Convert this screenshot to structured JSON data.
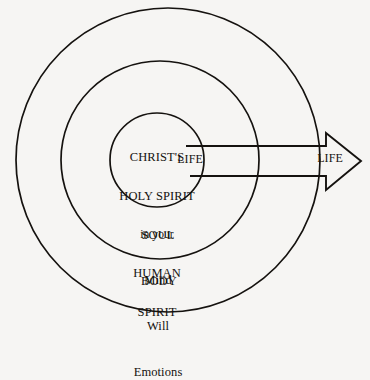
{
  "diagram": {
    "background_color": "#f6f5f3",
    "line_color": "#15120f",
    "rings": [
      {
        "name": "outer-ring",
        "label": "BODY",
        "cx": 168,
        "cy": 160,
        "r": 152
      },
      {
        "name": "middle-ring",
        "label": "SOUL",
        "cx": 160,
        "cy": 160,
        "r": 99
      },
      {
        "name": "inner-ring",
        "label": "SPIRIT",
        "cx": 157,
        "cy": 160,
        "r": 47
      }
    ],
    "spirit_lines": [
      {
        "text": "CHRIST'S",
        "style": "caps"
      },
      {
        "text": "HOLY SPIRIT",
        "style": "caps"
      },
      {
        "text": "in your",
        "style": "small"
      },
      {
        "text": "HUMAN",
        "style": "caps"
      },
      {
        "text": "SPIRIT",
        "style": "caps"
      }
    ],
    "soul_lines": [
      {
        "text": "SOUL"
      },
      {
        "text": "Mind"
      },
      {
        "text": "Will"
      },
      {
        "text": "Emotions"
      }
    ],
    "body_label": "BODY",
    "life_inner_label": "LIFE",
    "life_arrow_label": "LIFE",
    "arrow": {
      "name": "life-arrow",
      "direction": "right",
      "shaft_top_y": 146,
      "shaft_bottom_y": 176,
      "shaft_start_x": 186,
      "head_start_x": 326,
      "tip_x": 361,
      "head_top_y": 133,
      "head_bottom_y": 190
    }
  }
}
